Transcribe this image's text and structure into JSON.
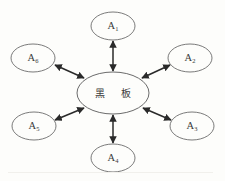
{
  "figure": {
    "type": "radial-hub-diagram",
    "background_color": "#fdfdfb",
    "stroke_color": "#6b6b6b",
    "arrow_color": "#2a2a2a",
    "center": {
      "label": "黑 板",
      "char_1": "黑",
      "char_2": "板",
      "cx": 113,
      "cy": 93,
      "rx": 36,
      "ry": 21
    },
    "nodes": [
      {
        "id": "a1",
        "base": "A",
        "subscript": "1",
        "label": "A₁",
        "cx": 113,
        "cy": 26,
        "rx": 22,
        "ry": 14
      },
      {
        "id": "a2",
        "base": "A",
        "subscript": "2",
        "label": "A₂",
        "cx": 190,
        "cy": 58,
        "rx": 22,
        "ry": 14
      },
      {
        "id": "a3",
        "base": "A",
        "subscript": "3",
        "label": "A₃",
        "cx": 192,
        "cy": 126,
        "rx": 22,
        "ry": 14
      },
      {
        "id": "a4",
        "base": "A",
        "subscript": "4",
        "label": "A₄",
        "cx": 113,
        "cy": 158,
        "rx": 22,
        "ry": 14
      },
      {
        "id": "a5",
        "base": "A",
        "subscript": "5",
        "label": "A₅",
        "cx": 34,
        "cy": 126,
        "rx": 22,
        "ry": 14
      },
      {
        "id": "a6",
        "base": "A",
        "subscript": "6",
        "label": "A₆",
        "cx": 33,
        "cy": 58,
        "rx": 22,
        "ry": 14
      }
    ],
    "connectors": [
      {
        "id": "edge-center-a1",
        "from": "center",
        "to": "a1",
        "arrowheads": "both"
      },
      {
        "id": "edge-center-a2",
        "from": "center",
        "to": "a2",
        "arrowheads": "both"
      },
      {
        "id": "edge-center-a3",
        "from": "center",
        "to": "a3",
        "arrowheads": "both"
      },
      {
        "id": "edge-center-a4",
        "from": "center",
        "to": "a4",
        "arrowheads": "both"
      },
      {
        "id": "edge-center-a5",
        "from": "center",
        "to": "a5",
        "arrowheads": "both"
      },
      {
        "id": "edge-center-a6",
        "from": "center",
        "to": "a6",
        "arrowheads": "both"
      }
    ]
  }
}
